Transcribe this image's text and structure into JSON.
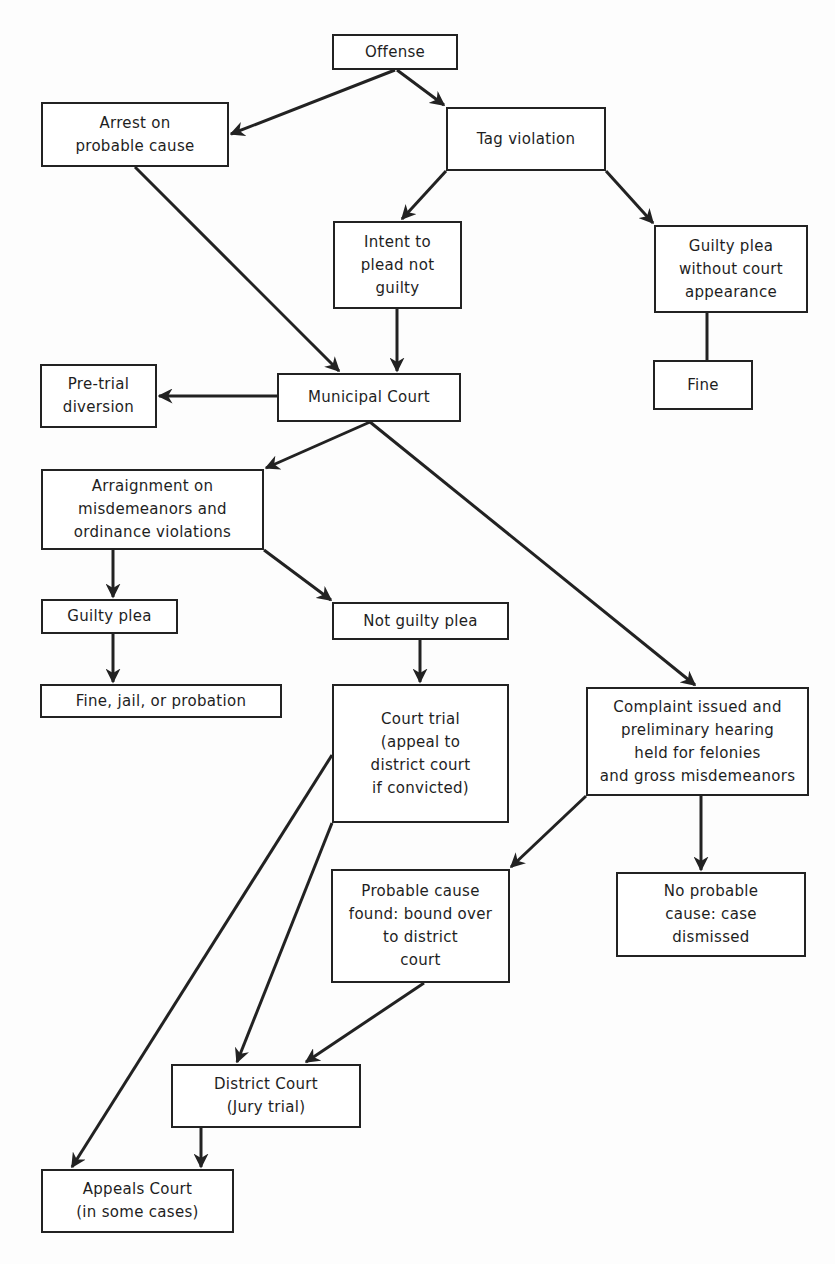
{
  "diagram": {
    "type": "flowchart",
    "title": "",
    "nodes": [
      {
        "id": "offense",
        "label": "Offense",
        "box": [
          332,
          34,
          126,
          36
        ]
      },
      {
        "id": "arrest",
        "label": "Arrest on\nprobable cause",
        "box": [
          41,
          102,
          188,
          65
        ]
      },
      {
        "id": "tag",
        "label": "Tag violation",
        "box": [
          446,
          107,
          160,
          64
        ]
      },
      {
        "id": "intent",
        "label": "Intent to\nplead not\nguilty",
        "box": [
          333,
          221,
          129,
          88
        ]
      },
      {
        "id": "guilty_no_court",
        "label": "Guilty plea\nwithout court\nappearance",
        "box": [
          654,
          225,
          154,
          88
        ]
      },
      {
        "id": "fine",
        "label": "Fine",
        "box": [
          653,
          360,
          100,
          50
        ]
      },
      {
        "id": "pretrial",
        "label": "Pre-trial\ndiversion",
        "box": [
          40,
          364,
          117,
          64
        ]
      },
      {
        "id": "municipal",
        "label": "Municipal Court",
        "box": [
          277,
          373,
          184,
          49
        ]
      },
      {
        "id": "arraignment",
        "label": "Arraignment on\nmisdemeanors and\nordinance violations",
        "box": [
          41,
          469,
          223,
          81
        ]
      },
      {
        "id": "guilty_plea",
        "label": "Guilty plea",
        "box": [
          41,
          599,
          137,
          35
        ]
      },
      {
        "id": "not_guilty",
        "label": "Not guilty plea",
        "box": [
          332,
          602,
          177,
          38
        ]
      },
      {
        "id": "fine_jail",
        "label": "Fine, jail, or probation",
        "box": [
          40,
          684,
          242,
          34
        ]
      },
      {
        "id": "court_trial",
        "label": "Court trial\n(appeal to\ndistrict court\nif convicted)",
        "box": [
          332,
          684,
          177,
          139
        ]
      },
      {
        "id": "complaint",
        "label": "Complaint issued and\npreliminary hearing\nheld for felonies\nand gross misdemeanors",
        "box": [
          586,
          687,
          223,
          109
        ]
      },
      {
        "id": "probable",
        "label": "Probable cause\nfound: bound over\nto district\ncourt",
        "box": [
          331,
          869,
          179,
          114
        ]
      },
      {
        "id": "no_probable",
        "label": "No probable\ncause: case\ndismissed",
        "box": [
          616,
          872,
          190,
          85
        ]
      },
      {
        "id": "district",
        "label": "District Court\n(Jury trial)",
        "box": [
          171,
          1064,
          190,
          64
        ]
      },
      {
        "id": "appeals",
        "label": "Appeals Court\n(in some cases)",
        "box": [
          41,
          1169,
          193,
          64
        ]
      }
    ],
    "edges": [
      {
        "from": "offense",
        "to": "arrest",
        "points": [
          395,
          70,
          231,
          134
        ],
        "arrow": true
      },
      {
        "from": "offense",
        "to": "tag",
        "points": [
          397,
          70,
          444,
          105
        ],
        "arrow": true
      },
      {
        "from": "tag",
        "to": "intent",
        "points": [
          446,
          171,
          402,
          219
        ],
        "arrow": true
      },
      {
        "from": "tag",
        "to": "guilty_no_court",
        "points": [
          606,
          171,
          653,
          223
        ],
        "arrow": true
      },
      {
        "from": "guilty_no_court",
        "to": "fine",
        "points": [
          707,
          313,
          707,
          360
        ],
        "arrow": false
      },
      {
        "from": "arrest",
        "to": "municipal",
        "points": [
          135,
          167,
          339,
          371
        ],
        "arrow": true
      },
      {
        "from": "intent",
        "to": "municipal",
        "points": [
          397,
          309,
          397,
          371
        ],
        "arrow": true
      },
      {
        "from": "municipal",
        "to": "pretrial",
        "points": [
          277,
          396,
          159,
          396
        ],
        "arrow": true
      },
      {
        "from": "municipal",
        "to": "arraignment",
        "points": [
          370,
          422,
          266,
          468
        ],
        "arrow": true
      },
      {
        "from": "municipal",
        "to": "complaint",
        "points": [
          370,
          422,
          695,
          685
        ],
        "arrow": true
      },
      {
        "from": "arraignment",
        "to": "guilty_plea",
        "points": [
          113,
          550,
          113,
          597
        ],
        "arrow": true
      },
      {
        "from": "arraignment",
        "to": "not_guilty",
        "points": [
          264,
          550,
          331,
          600
        ],
        "arrow": true
      },
      {
        "from": "guilty_plea",
        "to": "fine_jail",
        "points": [
          113,
          634,
          113,
          682
        ],
        "arrow": true
      },
      {
        "from": "not_guilty",
        "to": "court_trial",
        "points": [
          420,
          640,
          420,
          682
        ],
        "arrow": true
      },
      {
        "from": "court_trial",
        "to": "appeals",
        "points": [
          332,
          755,
          72,
          1167
        ],
        "arrow": true
      },
      {
        "from": "court_trial",
        "to": "district",
        "points": [
          332,
          823,
          237,
          1062
        ],
        "arrow": true
      },
      {
        "from": "complaint",
        "to": "probable",
        "points": [
          586,
          796,
          511,
          867
        ],
        "arrow": true
      },
      {
        "from": "complaint",
        "to": "no_probable",
        "points": [
          701,
          796,
          701,
          870
        ],
        "arrow": true
      },
      {
        "from": "probable",
        "to": "district",
        "points": [
          424,
          983,
          306,
          1062
        ],
        "arrow": true
      },
      {
        "from": "district",
        "to": "appeals",
        "points": [
          201,
          1128,
          201,
          1167
        ],
        "arrow": true
      }
    ]
  },
  "colors": {
    "line": "#222222",
    "box_border": "#222222",
    "background": "#fdfdfd"
  }
}
